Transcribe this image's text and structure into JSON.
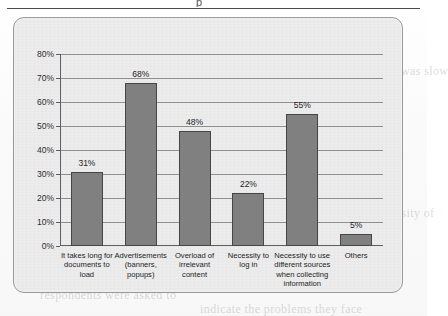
{
  "page": {
    "top_rule_glyph": "p",
    "background_ghost_text": [
      "the amount of time needed",
      "respondents who indicated that",
      "document retrieval was slow",
      "advertising content on pages",
      "was considered the main",
      "obstacle when searching for",
      "information on the internet",
      "other factors mentioned were",
      "the need to log in to access",
      "content and the necessity of",
      "using several different sources",
      "in order to collect the data",
      "required for the given task",
      "Figure 3",
      "respondents were asked to",
      "indicate the problems they face"
    ]
  },
  "chart_data": {
    "type": "bar",
    "title": "",
    "subtitle": "",
    "xlabel": "",
    "ylabel": "",
    "ylim": [
      0,
      80
    ],
    "ytick_labels": [
      "0%",
      "10%",
      "20%",
      "30%",
      "40%",
      "50%",
      "60%",
      "70%",
      "80%"
    ],
    "ytick_values": [
      0,
      10,
      20,
      30,
      40,
      50,
      60,
      70,
      80
    ],
    "grid": true,
    "legend": false,
    "legend_position": "none",
    "bar_fill_color": "#808080",
    "bar_border_color": "#464646",
    "plot_background_color": "#ececed",
    "categories": [
      "It takes long for documents to load",
      "Advertisements (banners, popups)",
      "Overload of irrelevant content",
      "Necessity to log in",
      "Necessity to use different sources when collecting information",
      "Others"
    ],
    "category_lines": [
      [
        "It takes long for",
        "documents to",
        "load"
      ],
      [
        "Advertisements",
        "(banners,",
        "popups)"
      ],
      [
        "Overload of",
        "irrelevant",
        "content"
      ],
      [
        "Necessity to",
        "log in"
      ],
      [
        "Necessity to use",
        "different sources",
        "when collecting",
        "information"
      ],
      [
        "Others"
      ]
    ],
    "values": [
      31,
      68,
      48,
      22,
      55,
      5
    ],
    "value_labels": [
      "31%",
      "68%",
      "48%",
      "22%",
      "55%",
      "5%"
    ]
  }
}
